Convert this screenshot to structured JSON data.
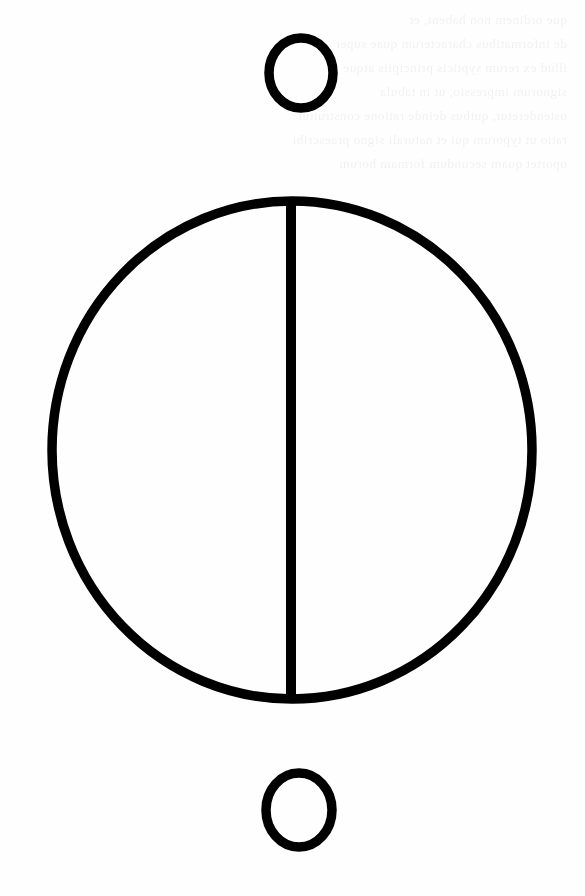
{
  "page": {
    "background_color": "#fefefe",
    "ink_color": "#000000",
    "width": 585,
    "height": 896
  },
  "figure": {
    "name": "bisected-circle-symbol",
    "stroke_color": "#000000",
    "stroke_width": 9.5,
    "fill": "none",
    "parts": [
      {
        "name": "upper-small-circle",
        "shape": "ellipse",
        "cx": 301,
        "cy": 73,
        "rx": 32,
        "ry": 35
      },
      {
        "name": "main-large-circle",
        "shape": "ellipse",
        "cx": 292,
        "cy": 450,
        "rx": 240,
        "ry": 249
      },
      {
        "name": "vertical-diameter-line",
        "shape": "line",
        "x1": 291,
        "y1": 199,
        "x2": 291,
        "y2": 701,
        "stroke_width": 10
      },
      {
        "name": "lower-small-circle",
        "shape": "ellipse",
        "cx": 299,
        "cy": 810,
        "rx": 33,
        "ry": 37
      }
    ]
  },
  "bleed_through": {
    "note": "Faint illegible show-through text from the reverse side of the scanned page",
    "opacity": 0.055,
    "lines": [
      "que ordinem non habent, et",
      "de informatibus characterum quae super",
      "illud ex rerum sypticis principiis atque",
      "signorum impressio, ut in tabula",
      "ostenderetur, quibus deinde ratione construitur",
      "ratio ut typorum qui et naturali signo praescribi",
      "oportet quam secundum formam horum"
    ]
  }
}
